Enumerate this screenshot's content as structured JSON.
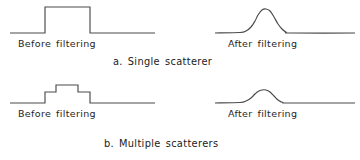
{
  "figure": {
    "background_color": "#ffffff",
    "stroke_color": "#4a4a4a",
    "text_color": "#1a1a1a",
    "width": 360,
    "height": 160
  },
  "labels": {
    "before_top": "Before filtering",
    "after_top": "After filtering",
    "before_bottom": "Before filtering",
    "after_bottom": "After filtering",
    "caption_a": "a.  Single  scatterer",
    "caption_b": "b.  Multiple  scatterers"
  },
  "chart_data": {
    "type": "line",
    "title": "",
    "xlabel": "",
    "ylabel": "",
    "grid": false,
    "legend": "none",
    "panels": [
      {
        "id": "a-before",
        "row": "a",
        "label": "Before filtering",
        "caption": "a.  Single  scatterer",
        "description": "single rectangular pulse, flat top",
        "baseline_y": 33,
        "x_start": 10,
        "x_end": 155,
        "points": [
          [
            10,
            33
          ],
          [
            45,
            33
          ],
          [
            45,
            7
          ],
          [
            90,
            7
          ],
          [
            90,
            33
          ],
          [
            155,
            33
          ]
        ]
      },
      {
        "id": "a-after",
        "row": "a",
        "label": "After filtering",
        "caption": "a.  Single  scatterer",
        "description": "smooth single-peaked gaussian bump",
        "baseline_y": 33,
        "x_start": 215,
        "x_end": 355,
        "peak_x": 262,
        "peak_y": 9,
        "points": [
          [
            215,
            33
          ],
          [
            240,
            32.5
          ],
          [
            246,
            31
          ],
          [
            251,
            27
          ],
          [
            255,
            21
          ],
          [
            258,
            15
          ],
          [
            262,
            10
          ],
          [
            266,
            9
          ],
          [
            270,
            11
          ],
          [
            274,
            17
          ],
          [
            278,
            24
          ],
          [
            282,
            29
          ],
          [
            286,
            32
          ],
          [
            292,
            33
          ],
          [
            355,
            33
          ]
        ]
      },
      {
        "id": "b-before",
        "row": "b",
        "label": "Before filtering",
        "caption": "b.  Multiple  scatterers",
        "description": "stepped pulse with three plateau levels representing multiple scatterers",
        "baseline_y": 103,
        "x_start": 10,
        "x_end": 155,
        "points": [
          [
            10,
            103
          ],
          [
            45,
            103
          ],
          [
            45,
            92
          ],
          [
            56,
            92
          ],
          [
            56,
            85
          ],
          [
            78,
            85
          ],
          [
            78,
            92
          ],
          [
            90,
            92
          ],
          [
            90,
            103
          ],
          [
            155,
            103
          ]
        ]
      },
      {
        "id": "b-after",
        "row": "b",
        "label": "After filtering",
        "caption": "b.  Multiple  scatterers",
        "description": "smooth single-peaked gaussian bump",
        "baseline_y": 103,
        "x_start": 215,
        "x_end": 355,
        "peak_x": 262,
        "peak_y": 90,
        "points": [
          [
            215,
            103
          ],
          [
            240,
            102.5
          ],
          [
            246,
            101
          ],
          [
            251,
            98
          ],
          [
            255,
            94
          ],
          [
            258,
            91.5
          ],
          [
            262,
            90
          ],
          [
            266,
            90
          ],
          [
            270,
            92
          ],
          [
            274,
            96
          ],
          [
            278,
            100
          ],
          [
            283,
            102.5
          ],
          [
            290,
            103
          ],
          [
            355,
            103
          ]
        ]
      }
    ]
  }
}
